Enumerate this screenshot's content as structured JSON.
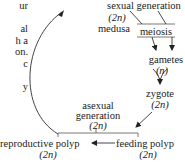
{
  "diagram": {
    "left_clipped_text": [
      "ur",
      "",
      "al",
      "h a",
      "on.",
      "c",
      "",
      "y"
    ],
    "nodes": {
      "sexual_generation": {
        "label": "sexual generation",
        "ploidy": "(2n)",
        "stage": "medusa"
      },
      "meiosis": {
        "label": "meiosis"
      },
      "gametes": {
        "label": "gametes",
        "ploidy": "(n)"
      },
      "zygote": {
        "label": "zygote",
        "ploidy": "(2n)"
      },
      "feeding_polyp": {
        "label": "feeding polyp",
        "ploidy": "(2n)"
      },
      "reproductive_polyp": {
        "label": "reproductive polyp",
        "ploidy": "(2n)"
      },
      "asexual_generation": {
        "line1": "asexual",
        "line2": "generation",
        "ploidy": "(2n)"
      }
    },
    "arrows": [
      {
        "from": "reproductive_polyp",
        "to": "sexual_generation",
        "shape": "curved"
      },
      {
        "from": "sexual_generation",
        "to": "meiosis"
      },
      {
        "from": "meiosis",
        "to": "gametes"
      },
      {
        "from": "gametes",
        "to": "zygote"
      },
      {
        "from": "zygote",
        "to": "feeding_polyp"
      },
      {
        "from": "feeding_polyp",
        "to": "reproductive_polyp"
      }
    ],
    "colors": {
      "line": "#333333",
      "text": "#222222",
      "background": "#ffffff"
    }
  }
}
